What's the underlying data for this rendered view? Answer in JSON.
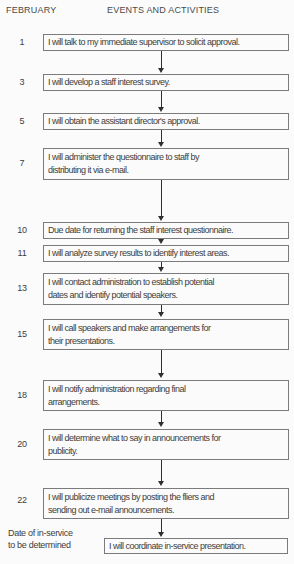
{
  "header": {
    "month_column": "FEBRUARY",
    "events_column": "EVENTS AND ACTIVITIES"
  },
  "colors": {
    "background": "#fbfbfb",
    "box_border": "#7b7b7b",
    "text": "#3d3d3d",
    "arrow": "#2f2f2f"
  },
  "flowchart": {
    "steps": [
      {
        "date": "1",
        "activity": "I will talk to my immediate supervisor to solicit approval."
      },
      {
        "date": "3",
        "activity": "I will develop a staff interest survey."
      },
      {
        "date": "5",
        "activity": "I will obtain the assistant director's approval."
      },
      {
        "date": "7",
        "activity": "I will administer the questionnaire to staff by\ndistributing it via e-mail."
      },
      {
        "date": "10",
        "activity": "Due date for returning the staff interest questionnaire."
      },
      {
        "date": "11",
        "activity": "I will analyze survey results to identify interest areas."
      },
      {
        "date": "13",
        "activity": "I will contact administration to establish potential\ndates and identify potential speakers."
      },
      {
        "date": "15",
        "activity": "I will call speakers and make arrangements for\ntheir presentations."
      },
      {
        "date": "18",
        "activity": "I will notify administration regarding final\narrangements."
      },
      {
        "date": "20",
        "activity": "I will determine what to say in announcements for\npublicity."
      },
      {
        "date": "22",
        "activity": "I will publicize meetings by posting the fliers and\nsending out e-mail announcements."
      },
      {
        "date": "Date of in-service\nto be determined",
        "activity": "I will coordinate in-service presentation."
      }
    ]
  }
}
